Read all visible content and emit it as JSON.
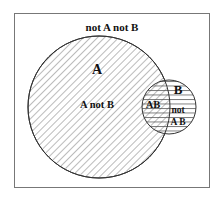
{
  "diagram": {
    "type": "venn",
    "outside_label": "not A not B",
    "set_a": {
      "name": "A",
      "region_label": "A not B",
      "fill_pattern": "diagonal-hatch"
    },
    "set_b": {
      "name": "B",
      "region_label_line1": "not",
      "region_label_line2": "A B",
      "fill_pattern": "horizontal-hatch"
    },
    "intersection_label": "AB",
    "colors": {
      "stroke": "#333333",
      "hatch": "#555555",
      "frame": "#777777",
      "text": "#111111"
    }
  }
}
